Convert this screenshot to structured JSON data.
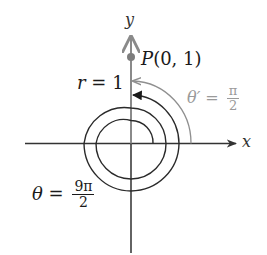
{
  "figure": {
    "axes": {
      "x_label": "x",
      "y_label": "y"
    },
    "point": {
      "label": "P(0, 1)",
      "name": "P",
      "coords": "(0, 1)"
    },
    "radius_label": {
      "var": "r",
      "eq": " = ",
      "value": "1"
    },
    "reference_angle": {
      "var": "θ′",
      "eq": " = ",
      "numerator": "π",
      "denominator": "2"
    },
    "angle": {
      "var": "θ",
      "eq": " = ",
      "numerator": "9π",
      "denominator": "2"
    },
    "colors": {
      "axis_dark": "#333333",
      "axis_grey": "#8a8a8a",
      "spiral": "#2a2a2a",
      "reference_arc": "#8f8f8f",
      "reference_text": "#9a9a9a",
      "point": "#7d7d7d",
      "text": "#1a1a1a"
    }
  }
}
